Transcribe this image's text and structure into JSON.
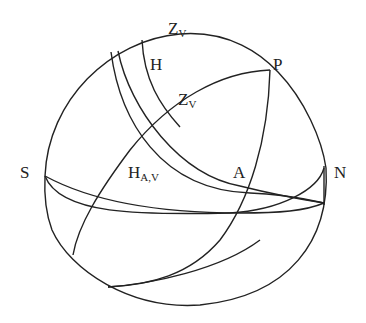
{
  "diagram": {
    "type": "celestial-sphere",
    "stroke_color": "#222222",
    "background": "#ffffff",
    "labels": {
      "zv_top": {
        "main": "Z",
        "sub": "V"
      },
      "h": {
        "main": "H",
        "sub": ""
      },
      "p": {
        "main": "P",
        "sub": ""
      },
      "zv_mid": {
        "main": "Z",
        "sub": "V"
      },
      "s": {
        "main": "S",
        "sub": ""
      },
      "hav": {
        "main": "H",
        "sub": "A,V"
      },
      "a": {
        "main": "A",
        "sub": ""
      },
      "n": {
        "main": "N",
        "sub": ""
      }
    }
  }
}
